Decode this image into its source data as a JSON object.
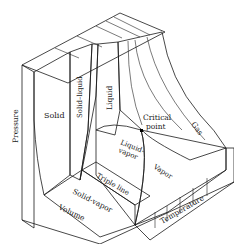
{
  "figure": {
    "regions": {
      "solid": "Solid",
      "solid_liquid": "Solid–liquid",
      "liquid": "Liquid",
      "critical_point": "Critical point",
      "critical_line1": "Critical",
      "critical_line2": "point",
      "gas": "Gas",
      "liquid_vapor_line1": "Liquid-",
      "liquid_vapor_line2": "vapor",
      "vapor": "Vapor",
      "triple_line": "Triple line",
      "solid_vapor": "Solid-vapor"
    },
    "axes": {
      "pressure": "Pressure",
      "volume": "Volume",
      "temperature": "Temperature"
    }
  }
}
